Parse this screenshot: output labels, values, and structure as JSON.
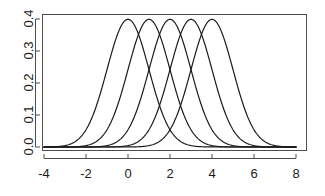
{
  "chart_data": {
    "type": "line",
    "title": "",
    "subtitle": "",
    "xlabel": "",
    "ylabel": "",
    "xlim": [
      -4,
      8
    ],
    "ylim": [
      0.0,
      0.4
    ],
    "xticks": [
      -4,
      -2,
      0,
      2,
      4,
      6,
      8
    ],
    "xtick_labels": [
      "-4",
      "-2",
      "0",
      "2",
      "4",
      "6",
      "8"
    ],
    "yticks": [
      0.0,
      0.1,
      0.2,
      0.3,
      0.4
    ],
    "ytick_labels": [
      "0.0",
      "0.1",
      "0.2",
      "0.3",
      "0.4"
    ],
    "grid": false,
    "legend": "none",
    "frame": "box",
    "line_color": "#1a1a1a",
    "line_width": 1.2,
    "background_color": "#ffffff",
    "series": [
      {
        "name": "Normal(mean=0, sd=1)",
        "mean": 0,
        "sd": 1,
        "peak_x": 0,
        "peak_y": 0.3989,
        "x": [
          -4.0,
          -3.6,
          -3.2,
          -2.8,
          -2.4,
          -2.0,
          -1.6,
          -1.2,
          -0.8,
          -0.4,
          0.0,
          0.4,
          0.8,
          1.2,
          1.6,
          2.0,
          2.4,
          2.8,
          3.2,
          3.6,
          4.0
        ],
        "values": [
          0.0001,
          0.0006,
          0.0024,
          0.0079,
          0.0224,
          0.054,
          0.1109,
          0.1942,
          0.2897,
          0.3683,
          0.3989,
          0.3683,
          0.2897,
          0.1942,
          0.1109,
          0.054,
          0.0224,
          0.0079,
          0.0024,
          0.0006,
          0.0001
        ]
      },
      {
        "name": "Normal(mean=1, sd=1)",
        "mean": 1,
        "sd": 1,
        "peak_x": 1,
        "peak_y": 0.3989,
        "x": [
          -3.0,
          -2.6,
          -2.2,
          -1.8,
          -1.4,
          -1.0,
          -0.6,
          -0.2,
          0.2,
          0.6,
          1.0,
          1.4,
          1.8,
          2.2,
          2.6,
          3.0,
          3.4,
          3.8,
          4.2,
          4.6,
          5.0
        ],
        "values": [
          0.0001,
          0.0006,
          0.0024,
          0.0079,
          0.0224,
          0.054,
          0.1109,
          0.1942,
          0.2897,
          0.3683,
          0.3989,
          0.3683,
          0.2897,
          0.1942,
          0.1109,
          0.054,
          0.0224,
          0.0079,
          0.0024,
          0.0006,
          0.0001
        ]
      },
      {
        "name": "Normal(mean=2, sd=1)",
        "mean": 2,
        "sd": 1,
        "peak_x": 2,
        "peak_y": 0.3989,
        "x": [
          -2.0,
          -1.6,
          -1.2,
          -0.8,
          -0.4,
          0.0,
          0.4,
          0.8,
          1.2,
          1.6,
          2.0,
          2.4,
          2.8,
          3.2,
          3.6,
          4.0,
          4.4,
          4.8,
          5.2,
          5.6,
          6.0
        ],
        "values": [
          0.0001,
          0.0006,
          0.0024,
          0.0079,
          0.0224,
          0.054,
          0.1109,
          0.1942,
          0.2897,
          0.3683,
          0.3989,
          0.3683,
          0.2897,
          0.1942,
          0.1109,
          0.054,
          0.0224,
          0.0079,
          0.0024,
          0.0006,
          0.0001
        ]
      },
      {
        "name": "Normal(mean=3, sd=1)",
        "mean": 3,
        "sd": 1,
        "peak_x": 3,
        "peak_y": 0.3989,
        "x": [
          -1.0,
          -0.6,
          -0.2,
          0.2,
          0.6,
          1.0,
          1.4,
          1.8,
          2.2,
          2.6,
          3.0,
          3.4,
          3.8,
          4.2,
          4.6,
          5.0,
          5.4,
          5.8,
          6.2,
          6.6,
          7.0
        ],
        "values": [
          0.0001,
          0.0006,
          0.0024,
          0.0079,
          0.0224,
          0.054,
          0.1109,
          0.1942,
          0.2897,
          0.3683,
          0.3989,
          0.3683,
          0.2897,
          0.1942,
          0.1109,
          0.054,
          0.0224,
          0.0079,
          0.0024,
          0.0006,
          0.0001
        ]
      },
      {
        "name": "Normal(mean=4, sd=1)",
        "mean": 4,
        "sd": 1,
        "peak_x": 4,
        "peak_y": 0.3989,
        "x": [
          0.0,
          0.4,
          0.8,
          1.2,
          1.6,
          2.0,
          2.4,
          2.8,
          3.2,
          3.6,
          4.0,
          4.4,
          4.8,
          5.2,
          5.6,
          6.0,
          6.4,
          6.8,
          7.2,
          7.6,
          8.0
        ],
        "values": [
          0.0001,
          0.0006,
          0.0024,
          0.0079,
          0.0224,
          0.054,
          0.1109,
          0.1942,
          0.2897,
          0.3683,
          0.3989,
          0.3683,
          0.2897,
          0.1942,
          0.1109,
          0.054,
          0.0224,
          0.0079,
          0.0024,
          0.0006,
          0.0001
        ]
      }
    ]
  }
}
